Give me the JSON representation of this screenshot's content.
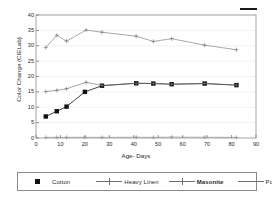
{
  "chart_data": {
    "type": "line",
    "title": "",
    "xlabel": "Age- Days",
    "ylabel": "Color Change (CIELab)",
    "xlim": [
      0,
      90
    ],
    "ylim": [
      0,
      40
    ],
    "xticks": [
      0,
      10,
      20,
      30,
      40,
      50,
      60,
      70,
      80,
      90
    ],
    "yticks": [
      0,
      5,
      10,
      15,
      20,
      25,
      30,
      35,
      40
    ],
    "grid": true,
    "legend_position": "bottom",
    "series": [
      {
        "name": "Cotton",
        "marker": "filled-square",
        "color": "#111111",
        "points": [
          [
            4,
            7.0
          ],
          [
            8.5,
            8.7
          ],
          [
            12.5,
            10.2
          ],
          [
            20,
            15.0
          ],
          [
            27,
            17.0
          ],
          [
            41,
            17.8
          ],
          [
            48,
            17.7
          ],
          [
            55.5,
            17.5
          ],
          [
            69,
            17.7
          ],
          [
            82,
            17.2
          ]
        ]
      },
      {
        "name": "Heavy Linen",
        "marker": "plus",
        "color": "#6e6e6e",
        "points": [
          [
            4,
            15.1
          ],
          [
            8.5,
            15.5
          ],
          [
            12.5,
            16.0
          ],
          [
            20.5,
            18.1
          ],
          [
            27,
            17.1
          ],
          [
            41,
            17.8
          ],
          [
            48,
            17.7
          ],
          [
            55.5,
            17.5
          ],
          [
            69,
            17.7
          ],
          [
            82,
            17.2
          ]
        ]
      },
      {
        "name": "Masonite",
        "marker": "plus",
        "color": "#8a8a8a",
        "points": [
          [
            4,
            0.2
          ],
          [
            8.5,
            0.2
          ],
          [
            12.5,
            0.2
          ],
          [
            20,
            0.25
          ],
          [
            27,
            0.2
          ],
          [
            41,
            0.25
          ],
          [
            48,
            0.2
          ],
          [
            55.5,
            0.3
          ],
          [
            69,
            0.25
          ],
          [
            82,
            0.2
          ]
        ]
      },
      {
        "name": "Polyester",
        "marker": "plus",
        "color": "#6e6e6e",
        "points": [
          [
            4,
            29.4
          ],
          [
            8.5,
            33.4
          ],
          [
            12.5,
            31.5
          ],
          [
            20.5,
            35.1
          ],
          [
            27,
            34.4
          ],
          [
            41,
            33.1
          ],
          [
            48,
            31.4
          ],
          [
            55.5,
            32.3
          ],
          [
            69,
            30.2
          ],
          [
            82,
            28.7
          ]
        ]
      }
    ]
  },
  "axes": {
    "xlabel": "Age- Days",
    "ylabel": "Color Change (CIELab)",
    "xtick_labels": [
      "0",
      "10",
      "20",
      "30",
      "40",
      "50",
      "60",
      "70",
      "80",
      "90"
    ],
    "ytick_labels": [
      "0",
      "5",
      "10",
      "15",
      "20",
      "25",
      "30",
      "35",
      "40"
    ]
  },
  "legend": {
    "items": [
      {
        "label": "Cotton",
        "marker": "filled-square"
      },
      {
        "label": "Heavy Linen",
        "marker": "plus"
      },
      {
        "label": "Masonite",
        "marker": "plus"
      },
      {
        "label": "Polyester",
        "marker": "plus"
      }
    ]
  }
}
